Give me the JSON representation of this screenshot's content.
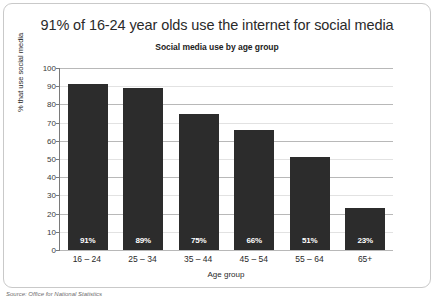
{
  "chart_data": {
    "type": "bar",
    "title": "91% of 16-24 year olds use the internet for social media",
    "subtitle": "Social media use by age group",
    "categories": [
      "16 – 24",
      "25 – 34",
      "35 – 44",
      "45 – 54",
      "55 – 64",
      "65+"
    ],
    "values": [
      91,
      89,
      75,
      66,
      51,
      23
    ],
    "data_labels": [
      "91%",
      "89%",
      "75%",
      "66%",
      "51%",
      "23%"
    ],
    "xlabel": "Age group",
    "ylabel": "% that use social media",
    "ylim": [
      0,
      100
    ],
    "ytick_step": 10,
    "yticks": [
      "100",
      "90",
      "80",
      "70",
      "60",
      "50",
      "40",
      "30",
      "20",
      "10",
      "0"
    ],
    "grid": true,
    "legend": "none",
    "bar_color": "#2c2c2c",
    "data_label_color": "#ffffff",
    "source": "Source: Office for National Statistics"
  }
}
